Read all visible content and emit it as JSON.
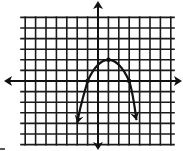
{
  "chart_data": {
    "type": "line",
    "title": "",
    "xlabel": "",
    "ylabel": "",
    "grid": true,
    "legend": null,
    "xlim": [
      -7,
      7
    ],
    "ylim": [
      -6,
      6
    ],
    "axis_arrows": true,
    "tick_labels": false,
    "series": [
      {
        "name": "parabola",
        "equation": "y = -0.5(x - 1)^2 + 2",
        "vertex": [
          1,
          2
        ],
        "x_intercepts": [
          -1,
          3
        ],
        "marked_points": [
          [
            -1,
            0
          ],
          [
            1,
            2
          ],
          [
            3,
            0
          ]
        ],
        "end_arrows": [
          [
            -2,
            -4
          ],
          [
            3.7,
            -3.7
          ]
        ],
        "opens": "down"
      }
    ]
  },
  "layout": {
    "origin_px": [
      98,
      81
    ],
    "unit_px_x": 10.4,
    "unit_px_y": 10.6,
    "grid_x_range": [
      -7,
      7
    ],
    "grid_y_range": [
      -6,
      6
    ],
    "line_color": "#111111",
    "background": "#ffffff"
  }
}
